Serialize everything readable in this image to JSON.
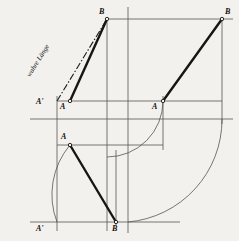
{
  "figure": {
    "kind": "descriptive-geometry-construction",
    "background_color": "#f2f1ee",
    "ink_color": "#2b2723",
    "thin_color": "#55504a",
    "width": 239,
    "height": 241,
    "annotation": {
      "text": "wahre Länge",
      "meaning": "true length",
      "style": "italic",
      "line_style": "dash-dot"
    },
    "labels": {
      "b_top_left": "B",
      "b_top_right": "B",
      "a_prime_left": "A'",
      "a_middle": "A",
      "a_right": "A",
      "a_lower": "A",
      "a_prime_bottom": "A'",
      "b_bottom": "B"
    },
    "geometry": {
      "verticals_x": [
        57,
        107,
        128,
        222
      ],
      "horizontals_y": [
        19,
        101,
        119,
        222
      ],
      "points": {
        "B_top_left": [
          107,
          19
        ],
        "B_top_right": [
          222,
          19
        ],
        "A_prime_left": [
          57,
          101
        ],
        "A_middle": [
          107,
          101
        ],
        "A_right": [
          163,
          101
        ],
        "A_lower": [
          70,
          145
        ],
        "A_prime_bottom": [
          57,
          222
        ],
        "B_bottom": [
          116,
          222
        ]
      },
      "arcs": [
        {
          "name": "small-arc-left",
          "from": [
            70,
            145
          ],
          "to": [
            57,
            222
          ],
          "radius": 77
        },
        {
          "name": "inner-quarter-arc",
          "from": [
            163,
            101
          ],
          "to": [
            107,
            157
          ],
          "radius": 56
        },
        {
          "name": "outer-quarter-arc",
          "from": [
            222,
            119
          ],
          "to": [
            128,
            222
          ],
          "radius": 103
        }
      ],
      "bold_segments": [
        {
          "name": "A-to-B-top-left",
          "from": [
            57,
            101
          ],
          "to": [
            107,
            19
          ]
        },
        {
          "name": "A-mid-to-B-top-left",
          "from": [
            70,
            101
          ],
          "to": [
            107,
            19
          ]
        },
        {
          "name": "A-right-to-B-top-right",
          "from": [
            163,
            101
          ],
          "to": [
            222,
            19
          ]
        },
        {
          "name": "A-lower-to-B-bottom",
          "from": [
            70,
            145
          ],
          "to": [
            116,
            222
          ]
        }
      ]
    }
  }
}
